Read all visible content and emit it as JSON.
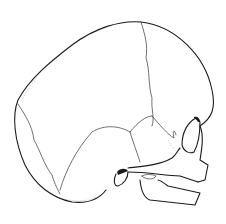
{
  "image": {
    "subject": "infant skull, lateral view",
    "style": "black ink line drawing on white",
    "background": "#ffffff",
    "ink": "#1a1a1a"
  }
}
